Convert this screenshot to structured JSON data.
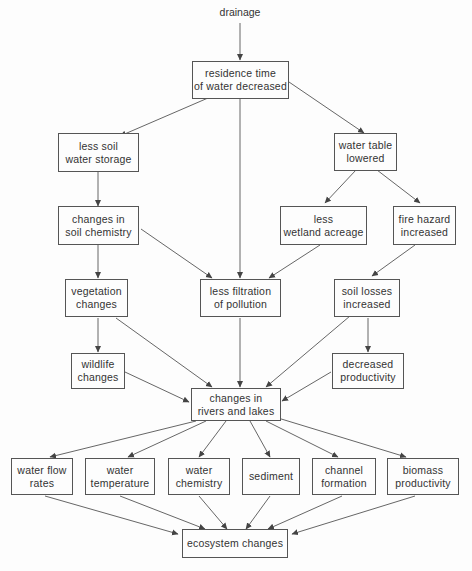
{
  "diagram": {
    "type": "flowchart",
    "source_label": "drainage",
    "nodes": {
      "residence": {
        "line1": "residence time",
        "line2": "of water decreased"
      },
      "soil_storage": {
        "line1": "less soil",
        "line2": "water storage"
      },
      "water_table": {
        "line1": "water table",
        "line2": "lowered"
      },
      "soil_chem": {
        "line1": "changes in",
        "line2": "soil chemistry"
      },
      "wetland": {
        "line1": "less",
        "line2": "wetland acreage"
      },
      "fire": {
        "line1": "fire hazard",
        "line2": "increased"
      },
      "vegetation": {
        "line1": "vegetation",
        "line2": "changes"
      },
      "filtration": {
        "line1": "less filtration",
        "line2": "of pollution"
      },
      "soil_losses": {
        "line1": "soil losses",
        "line2": "increased"
      },
      "wildlife": {
        "line1": "wildlife",
        "line2": "changes"
      },
      "productivity": {
        "line1": "decreased",
        "line2": "productivity"
      },
      "rivers": {
        "line1": "changes in",
        "line2": "rivers and lakes"
      },
      "flow": {
        "line1": "water flow",
        "line2": "rates"
      },
      "temperature": {
        "line1": "water",
        "line2": "temperature"
      },
      "chemistry": {
        "line1": "water",
        "line2": "chemistry"
      },
      "sediment": {
        "line1": "sediment"
      },
      "channel": {
        "line1": "channel",
        "line2": "formation"
      },
      "biomass": {
        "line1": "biomass",
        "line2": "productivity"
      },
      "ecosystem": {
        "line1": "ecosystem changes"
      }
    },
    "edges": [
      [
        "drainage",
        "residence"
      ],
      [
        "residence",
        "soil_storage"
      ],
      [
        "residence",
        "filtration"
      ],
      [
        "residence",
        "water_table"
      ],
      [
        "soil_storage",
        "soil_chem"
      ],
      [
        "water_table",
        "wetland"
      ],
      [
        "water_table",
        "fire"
      ],
      [
        "soil_chem",
        "vegetation"
      ],
      [
        "soil_chem",
        "filtration"
      ],
      [
        "wetland",
        "filtration"
      ],
      [
        "fire",
        "soil_losses"
      ],
      [
        "vegetation",
        "wildlife"
      ],
      [
        "vegetation",
        "rivers"
      ],
      [
        "filtration",
        "rivers"
      ],
      [
        "soil_losses",
        "rivers"
      ],
      [
        "soil_losses",
        "productivity"
      ],
      [
        "wildlife",
        "rivers"
      ],
      [
        "productivity",
        "rivers"
      ],
      [
        "rivers",
        "flow"
      ],
      [
        "rivers",
        "temperature"
      ],
      [
        "rivers",
        "chemistry"
      ],
      [
        "rivers",
        "sediment"
      ],
      [
        "rivers",
        "channel"
      ],
      [
        "rivers",
        "biomass"
      ],
      [
        "flow",
        "ecosystem"
      ],
      [
        "temperature",
        "ecosystem"
      ],
      [
        "chemistry",
        "ecosystem"
      ],
      [
        "sediment",
        "ecosystem"
      ],
      [
        "channel",
        "ecosystem"
      ],
      [
        "biomass",
        "ecosystem"
      ]
    ]
  }
}
